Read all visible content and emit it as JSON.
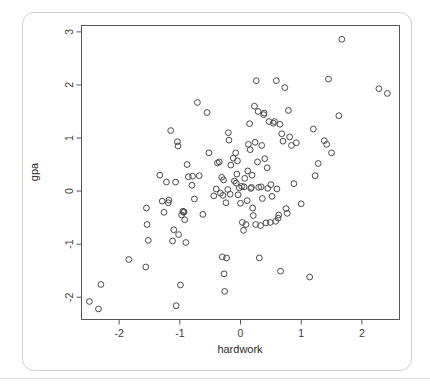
{
  "figure": {
    "card_border_color": "#cfcfcf",
    "background_color": "#ffffff",
    "point_stroke_color": "#4a4a4a",
    "axis_color": "#555555"
  },
  "chart_data": {
    "type": "scatter",
    "title": "",
    "xlabel": "hardwork",
    "ylabel": "gpa",
    "xlim": [
      -2.62,
      2.62
    ],
    "ylim": [
      -2.42,
      3.12
    ],
    "xticks": [
      -2,
      -1,
      0,
      1,
      2
    ],
    "xticklabels": [
      "-2",
      "-1",
      "0",
      "1",
      "2"
    ],
    "yticks": [
      -2,
      -1,
      0,
      1,
      2,
      3
    ],
    "yticklabels": [
      "-2",
      "-1",
      "0",
      "1",
      "2",
      "3"
    ],
    "grid": false,
    "legend": null,
    "marker": "open-circle",
    "n_points": 131,
    "points": [
      [
        -2.49,
        -2.08
      ],
      [
        -2.34,
        -2.22
      ],
      [
        -2.3,
        -1.76
      ],
      [
        -1.84,
        -1.29
      ],
      [
        -1.56,
        -1.43
      ],
      [
        -1.55,
        -0.32
      ],
      [
        -1.54,
        -0.63
      ],
      [
        -1.52,
        -0.93
      ],
      [
        -1.33,
        0.3
      ],
      [
        -1.29,
        -0.19
      ],
      [
        -1.26,
        -0.4
      ],
      [
        -1.22,
        0.17
      ],
      [
        -1.19,
        -0.22
      ],
      [
        -1.18,
        -0.17
      ],
      [
        -1.15,
        1.14
      ],
      [
        -1.12,
        -0.94
      ],
      [
        -1.1,
        -0.73
      ],
      [
        -1.07,
        0.17
      ],
      [
        -1.06,
        -2.16
      ],
      [
        -1.04,
        0.93
      ],
      [
        -1.03,
        0.85
      ],
      [
        -1.02,
        -0.82
      ],
      [
        -0.99,
        -1.77
      ],
      [
        -0.97,
        -0.45
      ],
      [
        -0.95,
        -0.38
      ],
      [
        -0.94,
        -0.4
      ],
      [
        -0.93,
        -0.39
      ],
      [
        -0.92,
        -0.54
      ],
      [
        -0.9,
        -0.97
      ],
      [
        -0.88,
        0.5
      ],
      [
        -0.86,
        0.27
      ],
      [
        -0.8,
        0.11
      ],
      [
        -0.79,
        0.28
      ],
      [
        -0.76,
        -0.15
      ],
      [
        -0.71,
        1.67
      ],
      [
        -0.68,
        0.29
      ],
      [
        -0.62,
        -0.44
      ],
      [
        -0.55,
        1.48
      ],
      [
        -0.52,
        0.72
      ],
      [
        -0.44,
        -0.09
      ],
      [
        -0.4,
        0.04
      ],
      [
        -0.38,
        0.53
      ],
      [
        -0.35,
        0.55
      ],
      [
        -0.33,
        -0.04
      ],
      [
        -0.31,
        0.26
      ],
      [
        -0.3,
        -1.24
      ],
      [
        -0.29,
        -0.08
      ],
      [
        -0.28,
        0.21
      ],
      [
        -0.27,
        -1.56
      ],
      [
        -0.26,
        -1.89
      ],
      [
        -0.24,
        -0.22
      ],
      [
        -0.23,
        -1.26
      ],
      [
        -0.21,
        0.03
      ],
      [
        -0.2,
        1.1
      ],
      [
        -0.19,
        0.96
      ],
      [
        -0.17,
        -0.06
      ],
      [
        -0.16,
        0.49
      ],
      [
        -0.12,
        0.62
      ],
      [
        -0.1,
        0.19
      ],
      [
        -0.08,
        0.72
      ],
      [
        -0.07,
        0.15
      ],
      [
        -0.06,
        0.32
      ],
      [
        -0.05,
        0.57
      ],
      [
        -0.04,
        -0.07
      ],
      [
        -0.02,
        0.06
      ],
      [
        0.0,
        -0.23
      ],
      [
        0.02,
        0.09
      ],
      [
        0.03,
        -0.59
      ],
      [
        0.05,
        -0.74
      ],
      [
        0.06,
        0.08
      ],
      [
        0.07,
        0.24
      ],
      [
        0.09,
        -0.63
      ],
      [
        0.11,
        -0.18
      ],
      [
        0.12,
        0.38
      ],
      [
        0.13,
        0.88
      ],
      [
        0.15,
        1.27
      ],
      [
        0.16,
        0.78
      ],
      [
        0.17,
        0.05
      ],
      [
        0.18,
        0.07
      ],
      [
        0.19,
        0.3
      ],
      [
        0.2,
        -0.32
      ],
      [
        0.21,
        -0.46
      ],
      [
        0.23,
        1.6
      ],
      [
        0.24,
        0.92
      ],
      [
        0.25,
        -0.63
      ],
      [
        0.26,
        2.08
      ],
      [
        0.28,
        0.55
      ],
      [
        0.29,
        1.5
      ],
      [
        0.3,
        0.07
      ],
      [
        0.31,
        -1.26
      ],
      [
        0.33,
        -0.65
      ],
      [
        0.34,
        0.08
      ],
      [
        0.35,
        0.86
      ],
      [
        0.36,
        -0.14
      ],
      [
        0.38,
        1.44
      ],
      [
        0.39,
        1.47
      ],
      [
        0.4,
        0.61
      ],
      [
        0.42,
        -0.6
      ],
      [
        0.44,
        0.44
      ],
      [
        0.45,
        0.05
      ],
      [
        0.47,
        1.31
      ],
      [
        0.49,
        -0.59
      ],
      [
        0.5,
        0.12
      ],
      [
        0.52,
        -0.1
      ],
      [
        0.54,
        1.28
      ],
      [
        0.56,
        1.31
      ],
      [
        0.58,
        -0.57
      ],
      [
        0.59,
        2.08
      ],
      [
        0.6,
        0.04
      ],
      [
        0.62,
        -0.51
      ],
      [
        0.63,
        -0.45
      ],
      [
        0.65,
        1.26
      ],
      [
        0.66,
        -1.51
      ],
      [
        0.68,
        1.08
      ],
      [
        0.7,
        0.94
      ],
      [
        0.73,
        1.95
      ],
      [
        0.75,
        -0.33
      ],
      [
        0.77,
        -0.42
      ],
      [
        0.79,
        1.52
      ],
      [
        0.81,
        1.02
      ],
      [
        0.84,
        0.86
      ],
      [
        0.88,
        0.14
      ],
      [
        0.92,
        0.91
      ],
      [
        1.0,
        -0.24
      ],
      [
        1.14,
        -1.62
      ],
      [
        1.2,
        1.17
      ],
      [
        1.23,
        0.29
      ],
      [
        1.28,
        0.52
      ],
      [
        1.38,
        0.95
      ],
      [
        1.42,
        0.88
      ],
      [
        1.45,
        2.11
      ],
      [
        1.5,
        0.72
      ],
      [
        1.62,
        1.42
      ],
      [
        1.67,
        2.86
      ],
      [
        2.28,
        1.93
      ],
      [
        2.42,
        1.84
      ]
    ]
  }
}
